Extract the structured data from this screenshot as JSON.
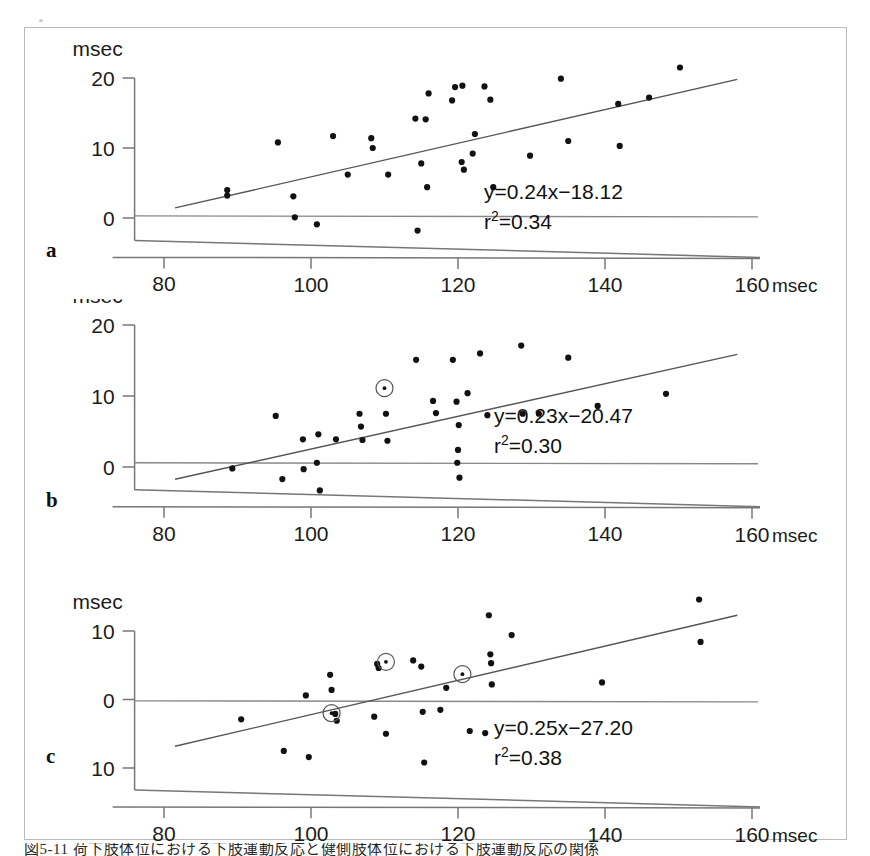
{
  "figure": {
    "caption": "図5-11 荷下肢体位における下肢運動反応と健側肢体位における下肢運動反応の関係",
    "panels": [
      "a",
      "b",
      "c"
    ],
    "axis_unit": "msec"
  },
  "chart_data": [
    {
      "type": "scatter",
      "panel": "a",
      "title": "",
      "xlabel": "msec",
      "ylabel": "msec",
      "xlim": [
        76,
        160
      ],
      "ylim": [
        -5,
        22
      ],
      "xticks": [
        80,
        100,
        120,
        140,
        160
      ],
      "yticks": [
        0,
        10,
        20
      ],
      "grid": false,
      "annotation_equation": "y=0.24x−18.12",
      "annotation_r2_base": "r",
      "annotation_r2_sup": "2",
      "annotation_r2_value": "=0.34",
      "slope": 0.24,
      "intercept": -18.12,
      "r2": 0.34,
      "fit_x_range": [
        81.5,
        158
      ],
      "zero_line_y": 0.3,
      "points": [
        {
          "x": 88.6,
          "y": 4.0
        },
        {
          "x": 88.6,
          "y": 3.2
        },
        {
          "x": 95.5,
          "y": 10.8
        },
        {
          "x": 97.6,
          "y": 3.1
        },
        {
          "x": 97.8,
          "y": 0.1
        },
        {
          "x": 100.8,
          "y": -0.9
        },
        {
          "x": 103.0,
          "y": 11.7
        },
        {
          "x": 105.0,
          "y": 6.2
        },
        {
          "x": 108.2,
          "y": 11.4
        },
        {
          "x": 108.4,
          "y": 10.0
        },
        {
          "x": 110.5,
          "y": 6.2
        },
        {
          "x": 114.2,
          "y": 14.2
        },
        {
          "x": 114.5,
          "y": -1.8
        },
        {
          "x": 115.0,
          "y": 7.8
        },
        {
          "x": 115.6,
          "y": 14.1
        },
        {
          "x": 115.8,
          "y": 4.4
        },
        {
          "x": 116.0,
          "y": 17.8
        },
        {
          "x": 119.2,
          "y": 16.8
        },
        {
          "x": 119.6,
          "y": 18.7
        },
        {
          "x": 120.5,
          "y": 8.0
        },
        {
          "x": 120.6,
          "y": 18.9
        },
        {
          "x": 120.8,
          "y": 6.9
        },
        {
          "x": 122.0,
          "y": 9.2
        },
        {
          "x": 122.3,
          "y": 12.0
        },
        {
          "x": 123.6,
          "y": 18.8
        },
        {
          "x": 124.4,
          "y": 16.9
        },
        {
          "x": 124.8,
          "y": 4.4
        },
        {
          "x": 129.8,
          "y": 8.9
        },
        {
          "x": 134.0,
          "y": 19.9
        },
        {
          "x": 135.0,
          "y": 11.0
        },
        {
          "x": 141.8,
          "y": 16.3
        },
        {
          "x": 142.0,
          "y": 10.3
        },
        {
          "x": 146.0,
          "y": 17.2
        },
        {
          "x": 150.2,
          "y": 21.5
        }
      ],
      "circled_points": []
    },
    {
      "type": "scatter",
      "panel": "b",
      "title": "",
      "xlabel": "msec",
      "ylabel": "msec",
      "xlim": [
        76,
        160
      ],
      "ylim": [
        -5,
        22
      ],
      "xticks": [
        80,
        100,
        120,
        140,
        160
      ],
      "yticks": [
        0,
        10,
        20
      ],
      "grid": false,
      "annotation_equation": "y=0.23x−20.47",
      "annotation_r2_base": "r",
      "annotation_r2_sup": "2",
      "annotation_r2_value": "=0.30",
      "slope": 0.23,
      "intercept": -20.47,
      "r2": 0.3,
      "fit_x_range": [
        81.5,
        158
      ],
      "zero_line_y": 0.6,
      "points": [
        {
          "x": 89.3,
          "y": -0.2
        },
        {
          "x": 95.2,
          "y": 7.2
        },
        {
          "x": 96.1,
          "y": -1.7
        },
        {
          "x": 98.9,
          "y": 3.9
        },
        {
          "x": 99.0,
          "y": -0.3
        },
        {
          "x": 100.8,
          "y": 0.6
        },
        {
          "x": 101.0,
          "y": 4.6
        },
        {
          "x": 101.2,
          "y": -3.3
        },
        {
          "x": 103.4,
          "y": 3.9
        },
        {
          "x": 106.6,
          "y": 7.5
        },
        {
          "x": 106.8,
          "y": 5.7
        },
        {
          "x": 107.0,
          "y": 3.8
        },
        {
          "x": 110.2,
          "y": 7.5
        },
        {
          "x": 110.4,
          "y": 3.7
        },
        {
          "x": 114.3,
          "y": 15.1
        },
        {
          "x": 116.6,
          "y": 9.3
        },
        {
          "x": 117.0,
          "y": 7.6
        },
        {
          "x": 119.3,
          "y": 15.1
        },
        {
          "x": 119.8,
          "y": 9.2
        },
        {
          "x": 119.9,
          "y": 0.6
        },
        {
          "x": 120.0,
          "y": 2.4
        },
        {
          "x": 120.1,
          "y": 5.9
        },
        {
          "x": 120.2,
          "y": -1.5
        },
        {
          "x": 121.3,
          "y": 10.4
        },
        {
          "x": 123.0,
          "y": 16.0
        },
        {
          "x": 124.0,
          "y": 7.3
        },
        {
          "x": 128.6,
          "y": 17.1
        },
        {
          "x": 128.8,
          "y": 7.5
        },
        {
          "x": 131.0,
          "y": 7.5
        },
        {
          "x": 135.0,
          "y": 15.4
        },
        {
          "x": 139.0,
          "y": 8.6
        },
        {
          "x": 148.3,
          "y": 10.3
        }
      ],
      "circled_points": [
        {
          "x": 110.0,
          "y": 11.1
        }
      ]
    },
    {
      "type": "scatter",
      "panel": "c",
      "title": "",
      "xlabel": "msec",
      "ylabel": "msec",
      "xlim": [
        76,
        160
      ],
      "ylim": [
        -12,
        16
      ],
      "xticks": [
        80,
        100,
        120,
        140,
        160
      ],
      "yticks": [
        -10,
        0,
        10
      ],
      "ytick_labels": [
        "10",
        "0",
        "10"
      ],
      "grid": false,
      "annotation_equation": "y=0.25x−27.20",
      "annotation_r2_base": "r",
      "annotation_r2_sup": "2",
      "annotation_r2_value": "=0.38",
      "slope": 0.25,
      "intercept": -27.2,
      "r2": 0.38,
      "fit_x_range": [
        81.5,
        158
      ],
      "zero_line_y": -0.2,
      "points": [
        {
          "x": 90.5,
          "y": -2.9
        },
        {
          "x": 96.3,
          "y": -7.5
        },
        {
          "x": 99.3,
          "y": 0.6
        },
        {
          "x": 99.7,
          "y": -8.4
        },
        {
          "x": 102.6,
          "y": 3.6
        },
        {
          "x": 102.8,
          "y": 1.4
        },
        {
          "x": 103.3,
          "y": -2.1
        },
        {
          "x": 103.5,
          "y": -3.1
        },
        {
          "x": 108.6,
          "y": -2.5
        },
        {
          "x": 109.2,
          "y": 4.6
        },
        {
          "x": 109.0,
          "y": 5.2
        },
        {
          "x": 110.2,
          "y": -5.0
        },
        {
          "x": 113.9,
          "y": 5.7
        },
        {
          "x": 115.0,
          "y": 4.8
        },
        {
          "x": 115.2,
          "y": -1.8
        },
        {
          "x": 115.4,
          "y": -9.2
        },
        {
          "x": 117.6,
          "y": -1.5
        },
        {
          "x": 118.4,
          "y": 1.7
        },
        {
          "x": 121.6,
          "y": -4.6
        },
        {
          "x": 123.7,
          "y": -4.9
        },
        {
          "x": 124.2,
          "y": 12.3
        },
        {
          "x": 124.4,
          "y": 6.6
        },
        {
          "x": 124.5,
          "y": 5.3
        },
        {
          "x": 124.6,
          "y": 2.2
        },
        {
          "x": 127.3,
          "y": 9.4
        },
        {
          "x": 139.6,
          "y": 2.5
        },
        {
          "x": 152.8,
          "y": 14.6
        },
        {
          "x": 153.0,
          "y": 8.4
        }
      ],
      "circled_points": [
        {
          "x": 110.2,
          "y": 5.5
        },
        {
          "x": 120.6,
          "y": 3.7
        },
        {
          "x": 102.8,
          "y": -2.0
        }
      ]
    }
  ]
}
